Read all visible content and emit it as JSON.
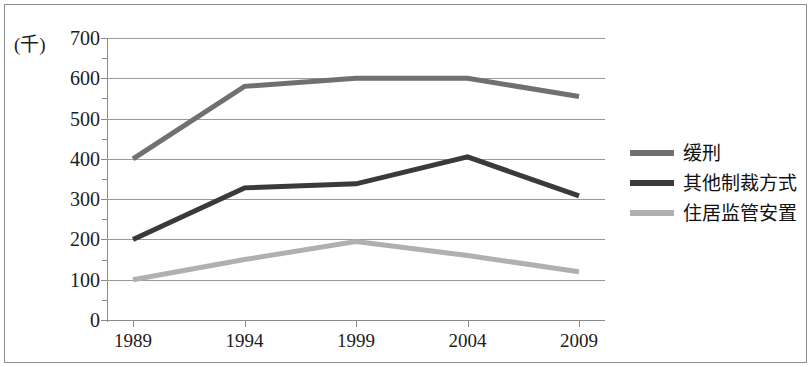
{
  "chart_data": {
    "type": "line",
    "title": "",
    "subtitle": "",
    "xlabel": "",
    "ylabel": "(千)",
    "y_unit_label": "(千)",
    "x": [
      "1989",
      "1994",
      "1999",
      "2004",
      "2009"
    ],
    "categories": [
      "1989",
      "1994",
      "1999",
      "2004",
      "2009"
    ],
    "xlim": [
      1989,
      2009
    ],
    "ylim": [
      0,
      700
    ],
    "y_ticks": [
      700,
      600,
      500,
      400,
      300,
      200,
      100,
      0
    ],
    "y_tick_labels": [
      "700",
      "600",
      "500",
      "400",
      "300",
      "200",
      "100",
      "0"
    ],
    "y_tick_step": 100,
    "grid": "horizontal",
    "legend_position": "right",
    "series": [
      {
        "name": "缓刑",
        "color": "#707070",
        "values": [
          400,
          580,
          600,
          600,
          555
        ]
      },
      {
        "name": "其他制裁方式",
        "color": "#3a3a3a",
        "values": [
          200,
          328,
          338,
          405,
          308
        ]
      },
      {
        "name": "住居监管安置",
        "color": "#b0b0b0",
        "values": [
          100,
          150,
          195,
          160,
          120
        ]
      }
    ]
  },
  "legend": {
    "items": [
      {
        "label": "缓刑",
        "color": "#707070"
      },
      {
        "label": "其他制裁方式",
        "color": "#3a3a3a"
      },
      {
        "label": "住居监管安置",
        "color": "#b0b0b0"
      }
    ]
  },
  "colors": {
    "axis": "#8a8a8a",
    "gridline": "#9a9a9a",
    "frame": "#8d8d8d",
    "text": "#1c1c1c",
    "background": "#ffffff"
  }
}
